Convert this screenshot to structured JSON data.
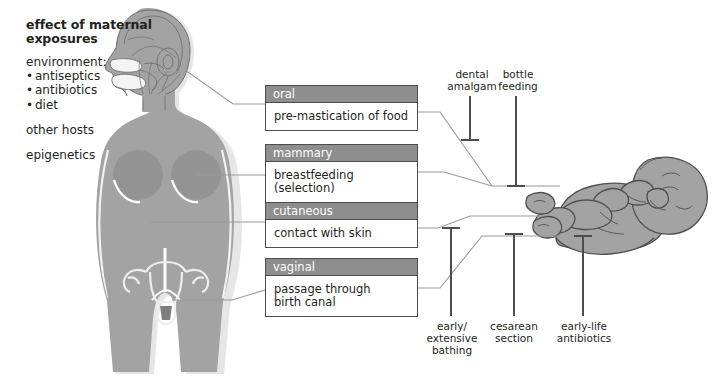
{
  "caption": {
    "title_line1": "effect of maternal",
    "title_line2": "exposures",
    "environment_label": "environment:",
    "environment_items": [
      "antiseptics",
      "antibiotics",
      "diet"
    ],
    "other_hosts": "other hosts",
    "epigenetics": "epigenetics"
  },
  "routes": [
    {
      "id": "oral",
      "header": "oral",
      "body": "pre-mastication of food"
    },
    {
      "id": "mammary",
      "header": "mammary",
      "body": "breastfeeding (selection)"
    },
    {
      "id": "cutaneous",
      "header": "cutaneous",
      "body": "contact with skin"
    },
    {
      "id": "vaginal",
      "header": "vaginal",
      "body_line1": "passage through",
      "body_line2": "birth canal"
    }
  ],
  "exposures": [
    {
      "id": "dental-amalgam",
      "line1": "dental",
      "line2": "amalgam"
    },
    {
      "id": "bottle-feeding",
      "line1": "bottle",
      "line2": "feeding"
    },
    {
      "id": "early-bathing",
      "line1": "early/",
      "line2": "extensive",
      "line3": "bathing"
    },
    {
      "id": "cesarean-section",
      "line1": "cesarean",
      "line2": "section"
    },
    {
      "id": "early-life-antibiotics",
      "line1": "early-life",
      "line2": "antibiotics"
    }
  ],
  "figures": {
    "mother": "maternal-body-illustration",
    "infant": "infant-illustration"
  },
  "colors": {
    "body_fill": "#a3a3a3",
    "body_shadow": "#d2d2d2",
    "outline": "#5a5a5a",
    "box_header": "#8e8e8e",
    "box_border": "#4d4d4d",
    "connector": "#9a9a9a",
    "blocker": "#4d4d4d",
    "text": "#231f20",
    "background": "#ffffff"
  }
}
